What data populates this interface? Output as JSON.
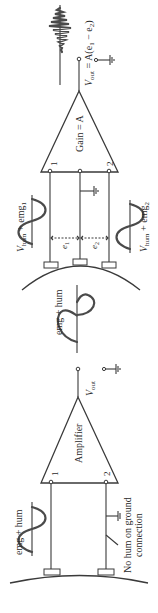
{
  "diagram": {
    "orientation": "rotated-90-ccw",
    "colors": {
      "line": "#3a3a3a",
      "text": "#2a2a2a",
      "background": "#ffffff"
    },
    "single_ended": {
      "amplifier_label": "Amplifier",
      "input_1": "1",
      "input_2": "2",
      "input_signal_label": "emg + hum",
      "output_label": "V",
      "output_sub": "out",
      "ground_note_line1": "No hum on ground",
      "ground_note_line2": "connection"
    },
    "middle": {
      "signal_label": "emg + hum"
    },
    "differential": {
      "gain_label": "Gain = A",
      "input_1": "1",
      "input_2": "2",
      "input_1_signal": "V",
      "input_1_signal_sub": "hum",
      "input_1_signal_rest": " + emg",
      "input_1_signal_rest_sub": "1",
      "input_2_signal": "V",
      "input_2_signal_sub": "hum",
      "input_2_signal_rest": " + emg",
      "input_2_signal_rest_sub": "2",
      "e1_label": "e",
      "e1_sub": "1",
      "e2_label": "e",
      "e2_sub": "2",
      "output_label": "V",
      "output_sub": "out",
      "output_eq": " = A(e",
      "output_eq_sub1": "1",
      "output_eq_mid": " − e",
      "output_eq_sub2": "2",
      "output_eq_end": ")"
    }
  }
}
